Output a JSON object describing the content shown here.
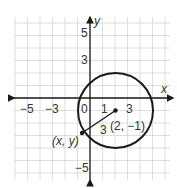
{
  "figure": {
    "type": "coordinate-plane-circle",
    "axes": {
      "x_label": "x",
      "y_label": "y",
      "x_ticks": [
        "−5",
        "−3",
        "0",
        "1",
        "3"
      ],
      "y_ticks": [
        "5",
        "3",
        "−5"
      ]
    },
    "circle": {
      "center": [
        2,
        -1
      ],
      "radius": 3,
      "center_label": "(2, −1)",
      "point_label": "(x, y)",
      "radius_label": "3"
    },
    "colors": {
      "grid": "#d4d4d4",
      "ink": "#1a1a1a",
      "text": "#333333"
    }
  }
}
